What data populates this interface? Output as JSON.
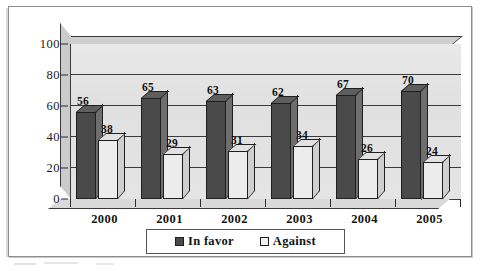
{
  "chart_data": {
    "type": "bar",
    "title": "",
    "subtitle": "",
    "xlabel": "",
    "ylabel": "",
    "categories": [
      "2000",
      "2001",
      "2002",
      "2003",
      "2004",
      "2005"
    ],
    "series": [
      {
        "name": "In favor",
        "color": "#4a4a4a",
        "values": [
          56,
          65,
          63,
          62,
          67,
          70
        ]
      },
      {
        "name": "Against",
        "color": "#ececec",
        "values": [
          38,
          29,
          31,
          34,
          26,
          24
        ]
      }
    ],
    "ylim": [
      0,
      100
    ],
    "yticks": [
      0,
      20,
      40,
      60,
      80,
      100
    ],
    "ytick_labels": [
      "0",
      "20",
      "40",
      "60",
      "80",
      "100"
    ],
    "grid": true,
    "legend_position": "bottom",
    "data_labels": true,
    "style_3d": true,
    "plot_background": "#e0e0e0"
  },
  "legend": {
    "items": [
      {
        "label": "In favor",
        "swatch": "favor"
      },
      {
        "label": "Against",
        "swatch": "against"
      }
    ]
  }
}
